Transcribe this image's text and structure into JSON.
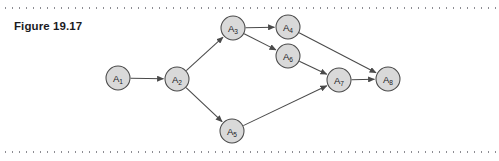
{
  "figure": {
    "title": "Figure 19.17",
    "rules": {
      "top_label": "top-dotted-rule",
      "bottom_label": "bottom-dotted-rule"
    }
  },
  "colors": {
    "node_fill": "#d9d9d9",
    "node_stroke": "#4a4a4a",
    "edge_stroke": "#4a4a4a",
    "text": "#1b1b1f",
    "rule": "#8d8d93",
    "background": "#ffffff"
  },
  "graph": {
    "type": "directed-graph",
    "node_radius": 12,
    "nodes": [
      {
        "id": "A1",
        "base": "A",
        "sub": "1",
        "x": 118,
        "y": 78
      },
      {
        "id": "A2",
        "base": "A",
        "sub": "2",
        "x": 177,
        "y": 79
      },
      {
        "id": "A3",
        "base": "A",
        "sub": "3",
        "x": 233,
        "y": 28
      },
      {
        "id": "A4",
        "base": "A",
        "sub": "4",
        "x": 288,
        "y": 27
      },
      {
        "id": "A5",
        "base": "A",
        "sub": "5",
        "x": 232,
        "y": 131
      },
      {
        "id": "A6",
        "base": "A",
        "sub": "6",
        "x": 288,
        "y": 56
      },
      {
        "id": "A7",
        "base": "A",
        "sub": "7",
        "x": 339,
        "y": 80
      },
      {
        "id": "A8",
        "base": "A",
        "sub": "8",
        "x": 388,
        "y": 79
      }
    ],
    "edges": [
      {
        "from": "A1",
        "to": "A2"
      },
      {
        "from": "A2",
        "to": "A3"
      },
      {
        "from": "A2",
        "to": "A5"
      },
      {
        "from": "A3",
        "to": "A4"
      },
      {
        "from": "A3",
        "to": "A6"
      },
      {
        "from": "A4",
        "to": "A8"
      },
      {
        "from": "A5",
        "to": "A7"
      },
      {
        "from": "A6",
        "to": "A7"
      },
      {
        "from": "A7",
        "to": "A8"
      }
    ]
  }
}
